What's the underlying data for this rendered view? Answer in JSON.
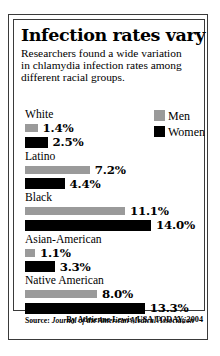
{
  "title": "Infection rates vary",
  "subtitle_lines": [
    "Researchers found a wide variation",
    "in chlamydia infection rates among",
    "different racial groups."
  ],
  "legend": {
    "men": {
      "label": "Men",
      "color": "#9a9a9a"
    },
    "women": {
      "label": "Women",
      "color": "#000000"
    }
  },
  "source": {
    "label": "Source: ",
    "publication": "Journal of the American Medical Association"
  },
  "byline": "By Adrienne Lewis, USA TODAY, 2004",
  "chart_data": {
    "type": "bar",
    "title": "Infection rates vary",
    "subtitle": "Researchers found a wide variation in chlamydia infection rates among different racial groups.",
    "xlabel": "",
    "ylabel": "Chlamydia infection rate (%)",
    "orientation": "horizontal",
    "grid": false,
    "legend_position": "top-right",
    "xlim": [
      0,
      14.0
    ],
    "units": "percent",
    "categories": [
      "White",
      "Latino",
      "Black",
      "Asian-American",
      "Native American"
    ],
    "series": [
      {
        "name": "Men",
        "color": "#9a9a9a",
        "values": [
          1.4,
          7.2,
          11.1,
          1.1,
          8.0
        ],
        "labels": [
          "1.4%",
          "7.2%",
          "11.1%",
          "1.1%",
          "8.0%"
        ]
      },
      {
        "name": "Women",
        "color": "#000000",
        "values": [
          2.5,
          4.4,
          14.0,
          3.3,
          13.3
        ],
        "labels": [
          "2.5%",
          "4.4%",
          "14.0%",
          "3.3%",
          "13.3%"
        ]
      }
    ],
    "groups": [
      {
        "label": "White",
        "men": {
          "value": 1.4,
          "label": "1.4%"
        },
        "women": {
          "value": 2.5,
          "label": "2.5%"
        }
      },
      {
        "label": "Latino",
        "men": {
          "value": 7.2,
          "label": "7.2%"
        },
        "women": {
          "value": 4.4,
          "label": "4.4%"
        }
      },
      {
        "label": "Black",
        "men": {
          "value": 11.1,
          "label": "11.1%"
        },
        "women": {
          "value": 14.0,
          "label": "14.0%"
        }
      },
      {
        "label": "Asian-American",
        "men": {
          "value": 1.1,
          "label": "1.1%"
        },
        "women": {
          "value": 3.3,
          "label": "3.3%"
        }
      },
      {
        "label": "Native American",
        "men": {
          "value": 8.0,
          "label": "8.0%"
        },
        "women": {
          "value": 13.3,
          "label": "13.3%"
        }
      }
    ]
  }
}
